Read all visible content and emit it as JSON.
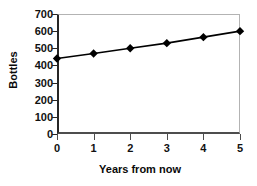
{
  "chart_data": {
    "type": "line",
    "title": "",
    "xlabel": "Years from now",
    "ylabel": "Bottles",
    "x": [
      0,
      1,
      2,
      3,
      4,
      5
    ],
    "values": [
      440,
      470,
      500,
      530,
      565,
      600
    ],
    "series": [
      {
        "name": "Bottles",
        "values": [
          440,
          470,
          500,
          530,
          565,
          600
        ]
      }
    ],
    "xlim": [
      0,
      5
    ],
    "ylim": [
      0,
      700
    ],
    "xticks": [
      "0",
      "1",
      "2",
      "3",
      "4",
      "5"
    ],
    "yticks": [
      "0",
      "100",
      "200",
      "300",
      "400",
      "500",
      "600",
      "700"
    ],
    "ytick_values": [
      0,
      100,
      200,
      300,
      400,
      500,
      600,
      700
    ],
    "grid": false,
    "legend": "none",
    "marker": "diamond",
    "marker_color": "#000000",
    "line_color": "#000000",
    "axis_color": "#262626",
    "frame_color": "#b3b3b3",
    "background": "#ffffff"
  }
}
